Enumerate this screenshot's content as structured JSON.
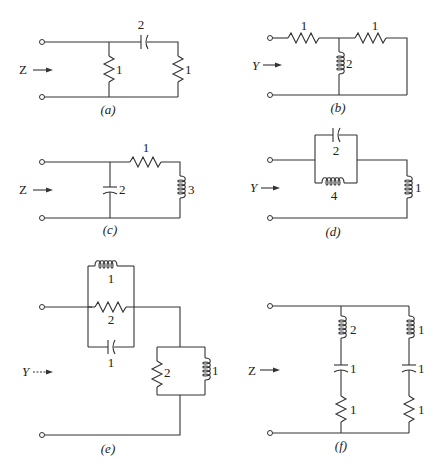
{
  "figure": {
    "panels": [
      {
        "id": "a",
        "caption": "(a)",
        "port_label": "Z",
        "elements": [
          {
            "type": "resistor",
            "value": "1",
            "position": "shunt-left"
          },
          {
            "type": "capacitor",
            "value": "2",
            "position": "series-top"
          },
          {
            "type": "resistor",
            "value": "1",
            "position": "shunt-right"
          }
        ]
      },
      {
        "id": "b",
        "caption": "(b)",
        "port_label": "Y",
        "elements": [
          {
            "type": "resistor",
            "value": "1",
            "position": "series-top-left"
          },
          {
            "type": "inductor",
            "value": "2",
            "position": "shunt-middle"
          },
          {
            "type": "resistor",
            "value": "1",
            "position": "series-top-right"
          }
        ]
      },
      {
        "id": "c",
        "caption": "(c)",
        "port_label": "Z",
        "elements": [
          {
            "type": "capacitor",
            "value": "2",
            "position": "shunt-left"
          },
          {
            "type": "resistor",
            "value": "1",
            "position": "series-top"
          },
          {
            "type": "inductor",
            "value": "3",
            "position": "shunt-right"
          }
        ]
      },
      {
        "id": "d",
        "caption": "(d)",
        "port_label": "Y",
        "elements": [
          {
            "type": "capacitor",
            "value": "2",
            "position": "parallel-top"
          },
          {
            "type": "inductor",
            "value": "4",
            "position": "parallel-bottom"
          },
          {
            "type": "inductor",
            "value": "1",
            "position": "shunt-right"
          }
        ]
      },
      {
        "id": "e",
        "caption": "(e)",
        "port_label": "Y",
        "elements": [
          {
            "type": "inductor",
            "value": "1",
            "position": "parallel-top"
          },
          {
            "type": "resistor",
            "value": "2",
            "position": "parallel-middle"
          },
          {
            "type": "capacitor",
            "value": "1",
            "position": "parallel-bottom"
          },
          {
            "type": "resistor",
            "value": "2",
            "position": "shunt-parallel-left"
          },
          {
            "type": "inductor",
            "value": "1",
            "position": "shunt-parallel-right"
          }
        ]
      },
      {
        "id": "f",
        "caption": "(f)",
        "port_label": "Z",
        "elements": [
          {
            "type": "inductor",
            "value": "2",
            "position": "branch1-top"
          },
          {
            "type": "capacitor",
            "value": "1",
            "position": "branch1-middle"
          },
          {
            "type": "resistor",
            "value": "1",
            "position": "branch1-bottom"
          },
          {
            "type": "inductor",
            "value": "1",
            "position": "branch2-top"
          },
          {
            "type": "capacitor",
            "value": "1",
            "position": "branch2-middle"
          },
          {
            "type": "resistor",
            "value": "1",
            "position": "branch2-bottom"
          }
        ]
      }
    ]
  }
}
